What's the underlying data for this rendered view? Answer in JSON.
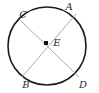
{
  "figure": {
    "type": "circle-with-two-intersecting-diameters",
    "canvas": {
      "width": 99,
      "height": 93
    },
    "background_color": "#ffffff",
    "circle": {
      "center_x": 47,
      "center_y": 46,
      "radius": 39,
      "stroke_color": "#1a1a1a",
      "stroke_width": 1.6,
      "fill": "none"
    },
    "center_marker": {
      "shape": "square",
      "x": 46,
      "y": 43,
      "size": 4,
      "color": "#111111"
    },
    "chords": [
      {
        "name": "chord-C-D",
        "from": "C",
        "to": "D",
        "x1": 21,
        "y1": 21,
        "x2": 79,
        "y2": 77,
        "stroke_color": "#a9a9a9",
        "stroke_width": 1
      },
      {
        "name": "chord-A-B",
        "from": "A",
        "to": "B",
        "x1": 76,
        "y1": 14,
        "x2": 22,
        "y2": 77,
        "stroke_color": "#a9a9a9",
        "stroke_width": 1
      }
    ],
    "points": [
      {
        "label": "A",
        "x": 69,
        "y": 7,
        "on": "circle"
      },
      {
        "label": "C",
        "x": 23,
        "y": 15,
        "on": "circle"
      },
      {
        "label": "E",
        "x": 57,
        "y": 43,
        "on": "center"
      },
      {
        "label": "B",
        "x": 26,
        "y": 85,
        "on": "circle"
      },
      {
        "label": "D",
        "x": 83,
        "y": 85,
        "on": "circle"
      }
    ]
  }
}
